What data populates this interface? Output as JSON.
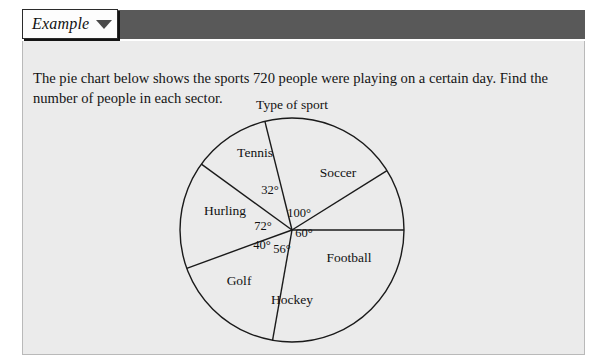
{
  "header": {
    "tab_label": "Example",
    "caret_icon": "chevron-down-icon"
  },
  "question": {
    "text": "The pie chart below shows the sports 720 people were playing on a certain day. Find the number of people in each sector."
  },
  "chart_data": {
    "type": "pie",
    "title": "Type of sport",
    "total_people": 720,
    "units": "degrees",
    "categories": [
      "Soccer",
      "Football",
      "Hockey",
      "Golf",
      "Hurling",
      "Tennis"
    ],
    "values": [
      100,
      60,
      56,
      40,
      72,
      32
    ],
    "angle_labels": [
      "100°",
      "60°",
      "56°",
      "40°",
      "72°",
      "32°"
    ],
    "legend": "none",
    "grid": false,
    "geometry": {
      "center_x": 291,
      "center_y": 230,
      "radius": 112,
      "start_angle_deg": 0,
      "direction": "clockwise"
    },
    "sectors": [
      {
        "name": "Soccer",
        "angle": 100,
        "angle_label": "100°",
        "label_x": 337,
        "label_y": 173,
        "angle_label_x": 298,
        "angle_label_y": 213
      },
      {
        "name": "Football",
        "angle": 60,
        "angle_label": "60°",
        "label_x": 348,
        "label_y": 258,
        "angle_label_x": 303,
        "angle_label_y": 233
      },
      {
        "name": "Hockey",
        "angle": 56,
        "angle_label": "56°",
        "label_x": 291,
        "label_y": 300,
        "angle_label_x": 281,
        "angle_label_y": 249
      },
      {
        "name": "Golf",
        "angle": 40,
        "angle_label": "40°",
        "label_x": 238,
        "label_y": 281,
        "angle_label_x": 261,
        "angle_label_y": 245
      },
      {
        "name": "Hurling",
        "angle": 72,
        "angle_label": "72°",
        "label_x": 224,
        "label_y": 211,
        "angle_label_x": 262,
        "angle_label_y": 226
      },
      {
        "name": "Tennis",
        "angle": 32,
        "angle_label": "32°",
        "label_x": 254,
        "label_y": 153,
        "angle_label_x": 269,
        "angle_label_y": 190
      }
    ],
    "title_x": 291,
    "title_y": 105
  },
  "colors": {
    "header_bar": "#595959",
    "panel_background": "#ebebeb",
    "page_background": "#ffffff",
    "stroke": "#1a1a1a",
    "text": "#141414"
  }
}
